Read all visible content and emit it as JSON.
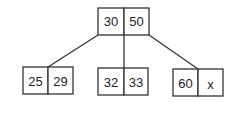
{
  "diagram": {
    "type": "b-tree",
    "root": {
      "keys": [
        "30",
        "50"
      ]
    },
    "children": [
      {
        "keys": [
          "25",
          "29"
        ]
      },
      {
        "keys": [
          "32",
          "33"
        ]
      },
      {
        "keys": [
          "60",
          "x"
        ]
      }
    ],
    "colors": {
      "stroke": "#333333",
      "text": "#222222",
      "background": "#ffffff"
    }
  }
}
